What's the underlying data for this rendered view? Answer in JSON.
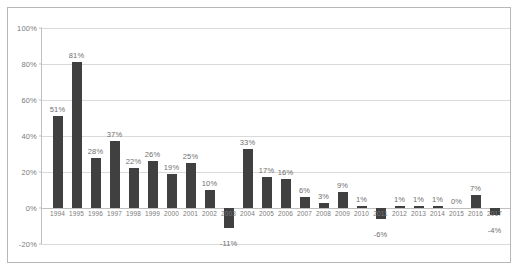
{
  "chart_data": {
    "type": "bar",
    "title": "",
    "subtitle": "",
    "xlabel": "",
    "ylabel": "",
    "ylim": [
      -20,
      100
    ],
    "ytick_step": 20,
    "ytick_labels": [
      "100%",
      "80%",
      "60%",
      "40%",
      "20%",
      "0%",
      "-20%"
    ],
    "ytick_values": [
      100,
      80,
      60,
      40,
      20,
      0,
      -20
    ],
    "grid": true,
    "legend": "none",
    "bar_color": "#404040",
    "gridline_color": "#d9d9d9",
    "axis_color": "#bfbfbf",
    "label_color": "#7b7b7b",
    "value_label_color": "#6f6f6f",
    "border_color": "#b7b7b7",
    "background_color": "#ffffff",
    "categories": [
      "1994",
      "1995",
      "1996",
      "1997",
      "1998",
      "1999",
      "2000",
      "2001",
      "2002",
      "2003",
      "2004",
      "2005",
      "2006",
      "2007",
      "2008",
      "2009",
      "2010",
      "2011",
      "2012",
      "2013",
      "2014",
      "2015",
      "2016",
      "2017"
    ],
    "values": [
      51,
      81,
      28,
      37,
      22,
      26,
      19,
      25,
      10,
      -11,
      33,
      17,
      16,
      6,
      3,
      9,
      1,
      -6,
      1,
      1,
      1,
      0,
      7,
      -4
    ],
    "data_labels": [
      "51%",
      "81%",
      "28%",
      "37%",
      "22%",
      "26%",
      "19%",
      "25%",
      "10%",
      "-11%",
      "33%",
      "17%",
      "16%",
      "6%",
      "3%",
      "9%",
      "1%",
      "-6%",
      "1%",
      "1%",
      "1%",
      "0%",
      "7%",
      "-4%"
    ]
  }
}
